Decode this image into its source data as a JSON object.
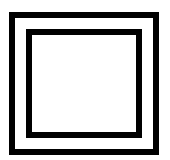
{
  "figure": {
    "colors": {
      "stroke": "#000000",
      "background": "#ffffff"
    },
    "outer_square": {
      "x": 9,
      "y": 12,
      "width": 150,
      "height": 143,
      "stroke_width": 6
    },
    "inner_square": {
      "x": 26,
      "y": 29,
      "width": 116,
      "height": 109,
      "stroke_width": 6
    }
  }
}
